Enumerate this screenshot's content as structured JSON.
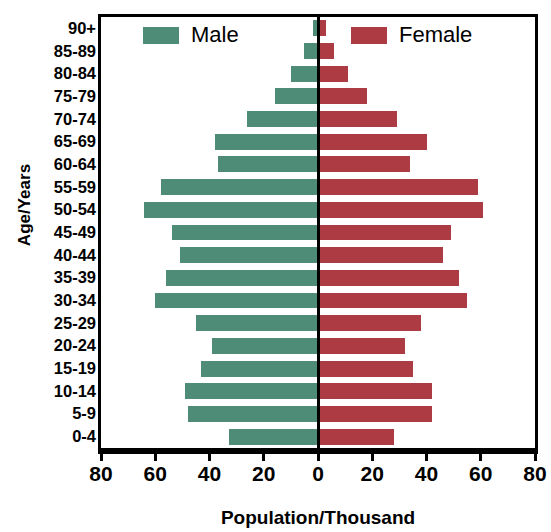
{
  "chart_data": {
    "type": "bar",
    "subtype": "population-pyramid",
    "title": "",
    "xlabel": "Population/Thousand",
    "ylabel": "Age/Years",
    "grid": false,
    "legend_position": "top-inside",
    "axis_max": 80,
    "xticks": [
      80,
      60,
      40,
      20,
      0,
      20,
      40,
      60,
      80
    ],
    "xtick_labels": [
      "80",
      "60",
      "40",
      "20",
      "0",
      "20",
      "40",
      "60",
      "80"
    ],
    "categories": [
      "90+",
      "85-89",
      "80-84",
      "75-79",
      "70-74",
      "65-69",
      "60-64",
      "55-59",
      "50-54",
      "45-49",
      "40-44",
      "35-39",
      "30-34",
      "25-29",
      "20-24",
      "15-19",
      "10-14",
      "5-9",
      "0-4"
    ],
    "series": [
      {
        "name": "Male",
        "color": "#4f8c77",
        "side": "left",
        "values": [
          2,
          5,
          10,
          16,
          26,
          38,
          37,
          58,
          64,
          54,
          51,
          56,
          60,
          45,
          39,
          43,
          49,
          48,
          33
        ]
      },
      {
        "name": "Female",
        "color": "#ad3b43",
        "side": "right",
        "values": [
          3,
          6,
          11,
          18,
          29,
          40,
          34,
          59,
          61,
          49,
          46,
          52,
          55,
          38,
          32,
          35,
          42,
          42,
          28
        ]
      }
    ]
  },
  "legend": [
    {
      "label": "Male",
      "swatch": "male"
    },
    {
      "label": "Female",
      "swatch": "female"
    }
  ]
}
